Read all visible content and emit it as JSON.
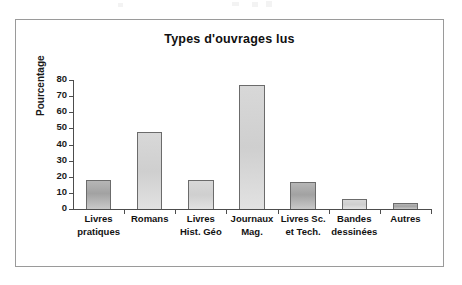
{
  "figure": {
    "title": "Types d'ouvrages lus"
  },
  "chart_data": {
    "type": "bar",
    "title": "Types d'ouvrages lus",
    "xlabel": "",
    "ylabel": "Pourcentage",
    "ylim": [
      0,
      80
    ],
    "ytick_step": 10,
    "yticks": [
      "80",
      "70",
      "60",
      "50",
      "40",
      "30",
      "20",
      "10",
      "0"
    ],
    "grid": false,
    "legend": null,
    "categories": [
      "Livres\npratiques",
      "Romans",
      "Livres\nHist. Géo",
      "Journaux\nMag.",
      "Livres Sc.\net Tech.",
      "Bandes\ndessinées",
      "Autres"
    ],
    "values": [
      18,
      48,
      18,
      77,
      17,
      6,
      4
    ],
    "bar_shades": [
      "dark",
      "light",
      "light",
      "light",
      "dark",
      "light",
      "dark"
    ],
    "colors": {
      "bar_fill_dark": "#a9a9a9",
      "bar_fill_light": "#d5d5d5",
      "bar_border": "#6b6b6b",
      "axis": "#4d4d4d",
      "text": "#121212",
      "frame": "#9a9a9a",
      "background": "#ffffff"
    }
  }
}
